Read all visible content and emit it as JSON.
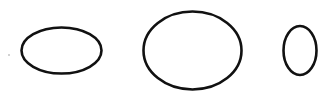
{
  "diagram": {
    "background": "#ffffff",
    "stroke_color": "#111111",
    "stroke_width": 2.6,
    "shapes": [
      {
        "type": "ellipse",
        "label": "wide-ellipse",
        "cx": 61.5,
        "cy": 50.5,
        "rx": 40,
        "ry": 23
      },
      {
        "type": "ellipse",
        "label": "large-ellipse",
        "cx": 192.5,
        "cy": 50.5,
        "rx": 49,
        "ry": 39
      },
      {
        "type": "ellipse",
        "label": "tall-ellipse",
        "cx": 300,
        "cy": 50.5,
        "rx": 16.5,
        "ry": 24.5
      }
    ],
    "specks": [
      {
        "cx": 9,
        "cy": 55,
        "r": 0.8,
        "color": "#9a9a9a"
      }
    ]
  }
}
